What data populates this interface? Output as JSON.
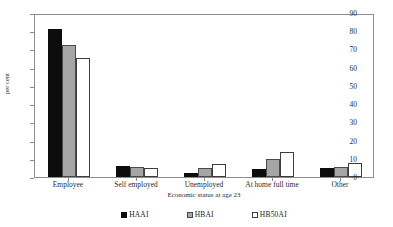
{
  "figure": {
    "title_sliver": "",
    "plot_border_color": "#8d8d8d",
    "background": "#ffffff"
  },
  "chart_data": {
    "type": "bar",
    "title": "",
    "xlabel": "Economic status at age 23",
    "ylabel": "per cent",
    "categories": [
      "Employee",
      "Self employed",
      "Unemployed",
      "At home full time",
      "Other"
    ],
    "series": [
      {
        "name": "HAAI",
        "color": "#0d0d0d",
        "values": [
          81,
          6,
          2,
          4.5,
          5
        ]
      },
      {
        "name": "HBAI",
        "color": "#a6a6a6",
        "values": [
          72.5,
          5.7,
          5,
          10,
          5.5
        ]
      },
      {
        "name": "HB50AI",
        "color": "#ffffff",
        "values": [
          65.5,
          5.2,
          7,
          13.5,
          7.5
        ]
      }
    ],
    "ylim": [
      0,
      90
    ],
    "yticks": [
      0,
      10,
      20,
      30,
      40,
      50,
      60,
      70,
      80,
      90
    ],
    "grid": false,
    "legend_position": "bottom"
  }
}
